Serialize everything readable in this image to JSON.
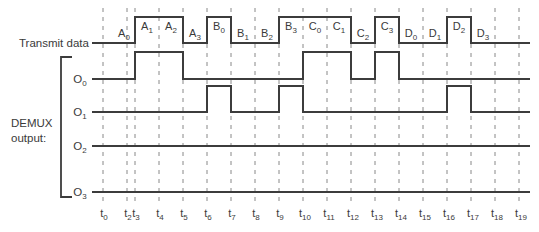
{
  "diagram": {
    "colors": {
      "line": "#3c3c3c",
      "grid": "#7a7a7a",
      "text": "#3a3a3a",
      "background": "#ffffff"
    },
    "transmit_label": "Transmit data",
    "demux_label_line1": "DEMUX",
    "demux_label_line2": "output:",
    "time_ticks": [
      {
        "base": "t",
        "sub": "0",
        "x": 103
      },
      {
        "base": "t",
        "sub": "2",
        "x": 127
      },
      {
        "base": "t",
        "sub": "3",
        "x": 135
      },
      {
        "base": "t",
        "sub": "4",
        "x": 159
      },
      {
        "base": "t",
        "sub": "5",
        "x": 183
      },
      {
        "base": "t",
        "sub": "6",
        "x": 207
      },
      {
        "base": "t",
        "sub": "7",
        "x": 231
      },
      {
        "base": "t",
        "sub": "8",
        "x": 255
      },
      {
        "base": "t",
        "sub": "9",
        "x": 279
      },
      {
        "base": "t",
        "sub": "10",
        "x": 303
      },
      {
        "base": "t",
        "sub": "11",
        "x": 327
      },
      {
        "base": "t",
        "sub": "12",
        "x": 351
      },
      {
        "base": "t",
        "sub": "13",
        "x": 375
      },
      {
        "base": "t",
        "sub": "14",
        "x": 399
      },
      {
        "base": "t",
        "sub": "15",
        "x": 423
      },
      {
        "base": "t",
        "sub": "16",
        "x": 447
      },
      {
        "base": "t",
        "sub": "17",
        "x": 471
      },
      {
        "base": "t",
        "sub": "18",
        "x": 495
      },
      {
        "base": "t",
        "sub": "19",
        "x": 519
      }
    ],
    "transmit_data": {
      "y_low": 43,
      "y_high": 17,
      "x_start": 92,
      "x_end": 530,
      "transitions": [
        {
          "x": 135,
          "level": 1
        },
        {
          "x": 183,
          "level": 0
        },
        {
          "x": 207,
          "level": 1
        },
        {
          "x": 231,
          "level": 0
        },
        {
          "x": 279,
          "level": 1
        },
        {
          "x": 351,
          "level": 0
        },
        {
          "x": 375,
          "level": 1
        },
        {
          "x": 399,
          "level": 0
        },
        {
          "x": 447,
          "level": 1
        },
        {
          "x": 471,
          "level": 0
        }
      ],
      "bits": [
        {
          "base": "A",
          "sub": "0",
          "x": 124,
          "level": 0
        },
        {
          "base": "A",
          "sub": "1",
          "x": 147,
          "level": 1
        },
        {
          "base": "A",
          "sub": "2",
          "x": 171,
          "level": 1
        },
        {
          "base": "A",
          "sub": "3",
          "x": 195,
          "level": 0
        },
        {
          "base": "B",
          "sub": "0",
          "x": 219,
          "level": 1
        },
        {
          "base": "B",
          "sub": "1",
          "x": 243,
          "level": 0
        },
        {
          "base": "B",
          "sub": "2",
          "x": 267,
          "level": 0
        },
        {
          "base": "B",
          "sub": "3",
          "x": 291,
          "level": 1
        },
        {
          "base": "C",
          "sub": "0",
          "x": 315,
          "level": 1
        },
        {
          "base": "C",
          "sub": "1",
          "x": 339,
          "level": 1
        },
        {
          "base": "C",
          "sub": "2",
          "x": 363,
          "level": 0
        },
        {
          "base": "C",
          "sub": "3",
          "x": 387,
          "level": 1
        },
        {
          "base": "D",
          "sub": "0",
          "x": 411,
          "level": 0
        },
        {
          "base": "D",
          "sub": "1",
          "x": 435,
          "level": 0
        },
        {
          "base": "D",
          "sub": "2",
          "x": 459,
          "level": 1
        },
        {
          "base": "D",
          "sub": "3",
          "x": 483,
          "level": 0
        }
      ]
    },
    "outputs": [
      {
        "base": "O",
        "sub": "0",
        "y_low": 79,
        "y_high": 52,
        "pulses": [
          [
            135,
            183
          ],
          [
            303,
            351
          ],
          [
            375,
            399
          ]
        ]
      },
      {
        "base": "O",
        "sub": "1",
        "y_low": 112,
        "y_high": 86,
        "pulses": [
          [
            207,
            231
          ],
          [
            279,
            303
          ],
          [
            447,
            471
          ]
        ]
      },
      {
        "base": "O",
        "sub": "2",
        "y_low": 146,
        "y_high": 120,
        "pulses": []
      },
      {
        "base": "O",
        "sub": "3",
        "y_low": 192,
        "y_high": 166,
        "pulses": []
      }
    ]
  }
}
